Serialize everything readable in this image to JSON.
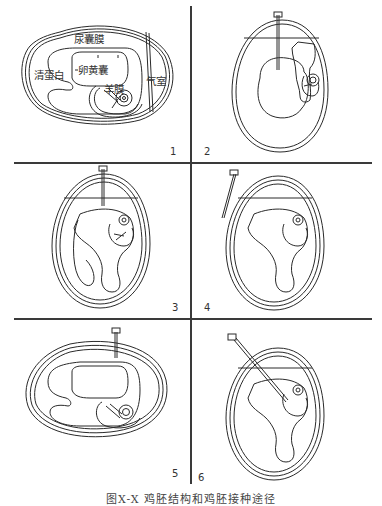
{
  "figure": {
    "caption": "图X-X  鸡胚结构和鸡胚接种途径",
    "line_color": "#2a2a2a",
    "panels": [
      {
        "number": "1",
        "labels": {
          "allantois": "尿囊膜",
          "yolk_sac": "卵黄囊",
          "albumen": "清蛋白",
          "air_cell": "气室",
          "amnion": "羊膜"
        }
      },
      {
        "number": "2"
      },
      {
        "number": "3"
      },
      {
        "number": "4"
      },
      {
        "number": "5"
      },
      {
        "number": "6"
      }
    ]
  }
}
